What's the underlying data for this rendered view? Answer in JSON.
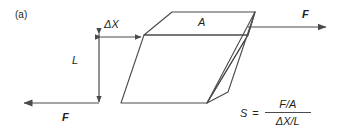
{
  "figure": {
    "panel_label": "(a)",
    "line_color": "#4a4a4a",
    "text_color": "#231f20",
    "background": "#ffffff"
  },
  "labels": {
    "delta_x": "ΔX",
    "length": "L",
    "area": "A",
    "force_top": "F",
    "force_bottom": "F"
  },
  "formula": {
    "symbol": "S",
    "equals": "=",
    "numerator": "F/A",
    "denominator": "ΔX/L"
  },
  "geometry": {
    "top_force_arrow": {
      "x1": 248,
      "y1": 27,
      "x2": 328,
      "y2": 27,
      "direction": "right"
    },
    "bottom_force_arrow": {
      "x1": 99,
      "y1": 103,
      "x2": 22,
      "y2": 103,
      "direction": "left"
    },
    "delta_x_arrow": {
      "x1": 99,
      "y1": 37,
      "x2": 143,
      "y2": 37,
      "direction": "both"
    },
    "length_arrow": {
      "x1": 99,
      "y1": 33,
      "x2": 99,
      "y2": 103,
      "direction": "both"
    },
    "front_face": [
      [
        121,
        103
      ],
      [
        207,
        103
      ],
      [
        248,
        35
      ],
      [
        144,
        35
      ]
    ],
    "top_face": [
      [
        144,
        35
      ],
      [
        248,
        35
      ],
      [
        255,
        12
      ],
      [
        172,
        12
      ]
    ],
    "right_face": [
      [
        248,
        35
      ],
      [
        255,
        12
      ],
      [
        228,
        92
      ],
      [
        207,
        103
      ]
    ]
  }
}
